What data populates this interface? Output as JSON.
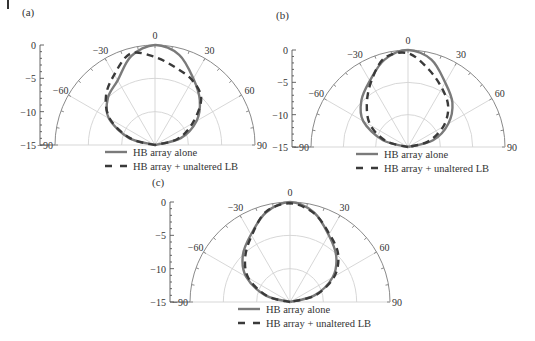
{
  "figure": {
    "corner_mark": "|",
    "legend": {
      "solid_label": "HB array alone",
      "dashed_label": "HB array + unaltered LB"
    },
    "styles": {
      "solid_color": "#7a7a7a",
      "dashed_color": "#3a3a3a",
      "grid_color": "#d2d2d2"
    }
  },
  "chart_data": [
    {
      "type": "polar-line",
      "panel": "(a)",
      "title": "(a)",
      "radial_axis": {
        "label_ticks": [
          "0",
          "-5",
          "-10",
          "-15"
        ],
        "range_db": [
          -15,
          0
        ]
      },
      "angular_ticks": [
        "-90",
        "-60",
        "-30",
        "0",
        "30",
        "60",
        "90"
      ],
      "angles_deg": [
        -90,
        -75,
        -60,
        -45,
        -30,
        -15,
        0,
        15,
        30,
        45,
        60,
        75,
        90
      ],
      "series": [
        {
          "name": "HB array alone",
          "style": "solid",
          "values": [
            -15,
            -11,
            -7,
            -5,
            -3.8,
            -1.2,
            0,
            -1.0,
            -3.5,
            -5.5,
            -7.8,
            -11,
            -15
          ]
        },
        {
          "name": "HB array + unaltered LB",
          "style": "dashed",
          "values": [
            -15,
            -11.2,
            -7.2,
            -4.6,
            -2.8,
            -0.8,
            -1.8,
            -3.0,
            -3.8,
            -5.2,
            -8.5,
            -11.5,
            -15
          ]
        }
      ],
      "legend_position": "below"
    },
    {
      "type": "polar-line",
      "panel": "(b)",
      "title": "(b)",
      "radial_axis": {
        "label_ticks": [
          "0",
          "-5",
          "-10",
          "-15"
        ],
        "range_db": [
          -15,
          0
        ]
      },
      "angular_ticks": [
        "-90",
        "-60",
        "-30",
        "0",
        "30",
        "60",
        "90"
      ],
      "angles_deg": [
        -90,
        -75,
        -60,
        -45,
        -30,
        -15,
        0,
        15,
        30,
        45,
        60,
        75,
        90
      ],
      "series": [
        {
          "name": "HB array alone",
          "style": "solid",
          "values": [
            -15,
            -11,
            -7,
            -4.8,
            -3.2,
            -1.0,
            0,
            -1.0,
            -3.5,
            -5.3,
            -7.8,
            -11,
            -15
          ]
        },
        {
          "name": "HB array + unaltered LB",
          "style": "dashed",
          "values": [
            -15,
            -11.5,
            -8.3,
            -6,
            -3.5,
            -0.8,
            -0.5,
            -2.6,
            -4.5,
            -6.2,
            -8.7,
            -11.8,
            -15
          ]
        }
      ],
      "legend_position": "below"
    },
    {
      "type": "polar-line",
      "panel": "(c)",
      "title": "(c)",
      "radial_axis": {
        "label_ticks": [
          "0",
          "-5",
          "-10",
          "-15"
        ],
        "range_db": [
          -15,
          0
        ]
      },
      "angular_ticks": [
        "-90",
        "-60",
        "-30",
        "0",
        "30",
        "60",
        "90"
      ],
      "angles_deg": [
        -90,
        -75,
        -60,
        -45,
        -30,
        -15,
        0,
        15,
        30,
        45,
        60,
        75,
        90
      ],
      "series": [
        {
          "name": "HB array alone",
          "style": "solid",
          "values": [
            -15,
            -11.2,
            -7.4,
            -5,
            -3.3,
            -1.1,
            0,
            -1.1,
            -3.4,
            -5.2,
            -7.6,
            -11.2,
            -15
          ]
        },
        {
          "name": "HB array + unaltered LB",
          "style": "dashed",
          "values": [
            -15,
            -11.4,
            -7.8,
            -5.5,
            -3.5,
            -1.0,
            -0.2,
            -1.2,
            -3.2,
            -4.8,
            -7.3,
            -11,
            -15
          ]
        }
      ],
      "legend_position": "below"
    }
  ]
}
